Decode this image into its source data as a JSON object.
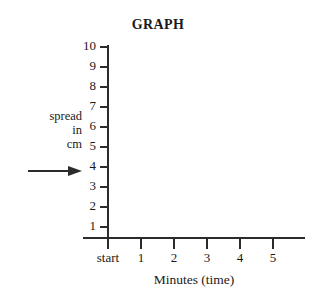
{
  "chart_data": {
    "type": "line",
    "title": "GRAPH",
    "xlabel": "Minutes (time)",
    "ylabel": "spread\nin\ncm",
    "ylabel_lines": [
      "spread",
      "in",
      "cm"
    ],
    "ylabel_arrow": "right-arrow",
    "x_categories": [
      "start",
      "1",
      "2",
      "3",
      "4",
      "5"
    ],
    "x_tick_labels": [
      "start",
      "1",
      "2",
      "3",
      "4",
      "5"
    ],
    "y_tick_labels": [
      "10",
      "9",
      "8",
      "7",
      "6",
      "5",
      "4",
      "3",
      "2",
      "1"
    ],
    "y_values": [
      10,
      9,
      8,
      7,
      6,
      5,
      4,
      3,
      2,
      1
    ],
    "ylim": [
      0,
      10
    ],
    "xlim": [
      0,
      5
    ],
    "grid": false,
    "legend": null,
    "series": [],
    "values": [],
    "note": "Empty axes template - no data plotted",
    "axis_color": "#2b2b2b",
    "background_color": "#ffffff",
    "text_color": "#1a1a1a"
  }
}
